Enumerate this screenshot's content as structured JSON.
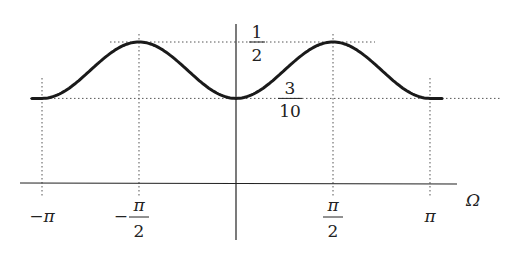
{
  "chart_data": {
    "type": "line",
    "title": "",
    "xlabel": "Ω",
    "ylabel": "",
    "function": "0.4 - 0.1*cos(2*Omega)",
    "xlim": [
      -3.14159,
      3.14159
    ],
    "ylim": [
      0,
      0.5
    ],
    "grid": false,
    "x_ticks": [
      {
        "value": -3.14159,
        "label_num": "−π",
        "label_den": ""
      },
      {
        "value": -1.5708,
        "label_num": "−π",
        "label_den": "2"
      },
      {
        "value": 1.5708,
        "label_num": "π",
        "label_den": "2"
      },
      {
        "value": 3.14159,
        "label_num": "π",
        "label_den": ""
      }
    ],
    "y_ticks": [
      {
        "value": 0.5,
        "label_num": "1",
        "label_den": "2"
      },
      {
        "value": 0.3,
        "label_num": "3",
        "label_den": "10"
      }
    ],
    "series": [
      {
        "name": "curve",
        "x": [
          -3.14159,
          -2.35619,
          -1.5708,
          -0.7854,
          0,
          0.7854,
          1.5708,
          2.35619,
          3.14159
        ],
        "y": [
          0.3,
          0.4,
          0.5,
          0.4,
          0.3,
          0.4,
          0.5,
          0.4,
          0.3
        ]
      }
    ],
    "reference_lines": [
      {
        "orientation": "vertical",
        "at": -3.14159,
        "style": "dotted"
      },
      {
        "orientation": "vertical",
        "at": -1.5708,
        "style": "dotted"
      },
      {
        "orientation": "vertical",
        "at": 1.5708,
        "style": "dotted"
      },
      {
        "orientation": "vertical",
        "at": 3.14159,
        "style": "dotted"
      },
      {
        "orientation": "horizontal",
        "at": 0.5,
        "style": "dotted"
      },
      {
        "orientation": "horizontal",
        "at": 0.3,
        "style": "dotted"
      }
    ]
  }
}
